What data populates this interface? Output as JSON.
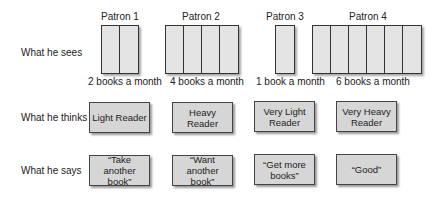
{
  "rows": {
    "sees": "What he sees",
    "thinks": "What he thinks",
    "says": "What he says"
  },
  "patrons": [
    {
      "name": "Patron 1",
      "books": 2,
      "caption": "2 books a month",
      "thinks": "Light Reader",
      "says": "“Take another book”"
    },
    {
      "name": "Patron 2",
      "books": 4,
      "caption": "4 books a month",
      "thinks": "Heavy Reader",
      "says": "“Want another book”"
    },
    {
      "name": "Patron 3",
      "books": 1,
      "caption": "1 book a month",
      "thinks": "Very Light Reader",
      "says": "“Get more books”"
    },
    {
      "name": "Patron 4",
      "books": 6,
      "caption": "6 books a month",
      "thinks": "Very Heavy Reader",
      "says": "“Good”"
    }
  ]
}
